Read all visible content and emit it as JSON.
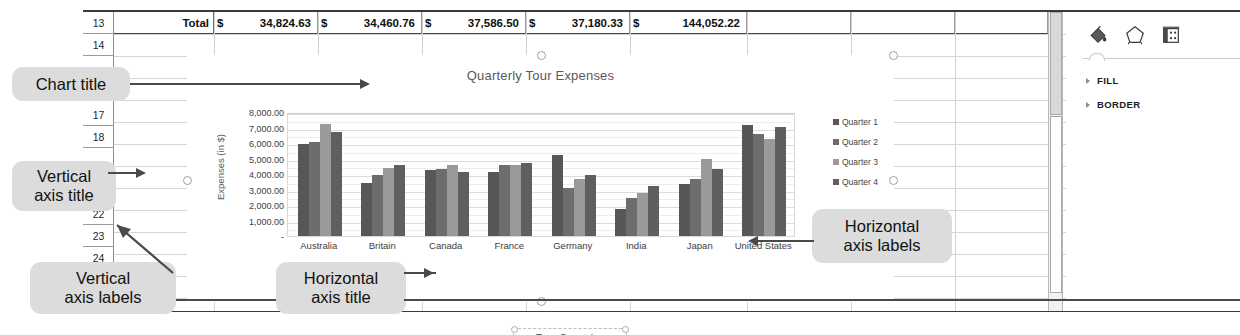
{
  "spreadsheet": {
    "row_headers": [
      "13",
      "14",
      "17",
      "18",
      "22",
      "23",
      "24"
    ],
    "total_row": {
      "label": "Total",
      "currency": "$",
      "values": [
        "34,824.63",
        "34,460.76",
        "37,586.50",
        "37,180.33",
        "144,052.22"
      ]
    }
  },
  "chart": {
    "title": "Quarterly Tour Expenses",
    "vertical_axis_title": "Expenses (in $)",
    "horizontal_axis_title": "Tour Countries",
    "legend": [
      "Quarter 1",
      "Quarter 2",
      "Quarter 3",
      "Quarter 4"
    ],
    "y_ticks": [
      "8,000.00",
      "7,000.00",
      "6,000.00",
      "5,000.00",
      "4,000.00",
      "3,000.00",
      "2,000.00",
      "1,000.00",
      "-"
    ]
  },
  "chart_data": {
    "type": "bar",
    "title": "Quarterly Tour Expenses",
    "xlabel": "Tour Countries",
    "ylabel": "Expenses (in $)",
    "ylim": [
      0,
      8000
    ],
    "grid": true,
    "legend_position": "right",
    "categories": [
      "Australia",
      "Britain",
      "Canada",
      "France",
      "Germany",
      "India",
      "Japan",
      "United States"
    ],
    "series": [
      {
        "name": "Quarter 1",
        "color": "#575757",
        "values": [
          5950,
          3450,
          4250,
          4100,
          5200,
          1750,
          3350,
          7150
        ]
      },
      {
        "name": "Quarter 2",
        "color": "#6d6d6d",
        "values": [
          6050,
          3950,
          4350,
          4550,
          3100,
          2450,
          3700,
          6550
        ]
      },
      {
        "name": "Quarter 3",
        "color": "#9a9a9a",
        "values": [
          7250,
          4400,
          4600,
          4600,
          3700,
          2800,
          4950,
          6250
        ]
      },
      {
        "name": "Quarter 4",
        "color": "#5f5f5f",
        "values": [
          6700,
          4550,
          4150,
          4700,
          3950,
          3200,
          4300,
          7050
        ]
      }
    ]
  },
  "format_pane": {
    "tools": [
      "fill-bucket-icon",
      "pentagon-shape-icon",
      "effects-icon"
    ],
    "sections": [
      "FILL",
      "BORDER"
    ]
  },
  "callouts": [
    {
      "id": "chart-title",
      "text": "Chart title"
    },
    {
      "id": "vertical-axis-title",
      "text": "Vertical\naxis title"
    },
    {
      "id": "vertical-axis-labels",
      "text": "Vertical\naxis labels"
    },
    {
      "id": "horizontal-axis-title",
      "text": "Horizontal\naxis title"
    },
    {
      "id": "horizontal-axis-labels",
      "text": "Horizontal\naxis labels"
    }
  ]
}
